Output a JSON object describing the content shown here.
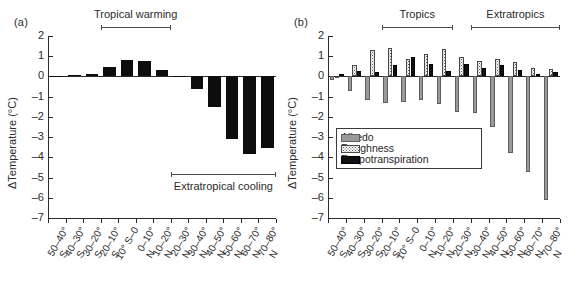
{
  "figure": {
    "panel_a_tag": "(a)",
    "panel_b_tag": "(b)"
  },
  "axes": {
    "ylabel": "ΔTemperature (°C)",
    "yticks": [
      "2",
      "1",
      "0",
      "-1",
      "-2",
      "-3",
      "-4",
      "-5",
      "-6",
      "-7"
    ],
    "ymin": -7,
    "ymax": 2,
    "categories": [
      {
        "line1": "50–40°",
        "line2": "S"
      },
      {
        "line1": "40–30°",
        "line2": "S"
      },
      {
        "line1": "30–20°",
        "line2": "S"
      },
      {
        "line1": "20–10°",
        "line2": "S"
      },
      {
        "line1": "10° S–0",
        "line2": ""
      },
      {
        "line1": "0–10°",
        "line2": "N"
      },
      {
        "line1": "10–20°",
        "line2": "N"
      },
      {
        "line1": "20–30°",
        "line2": "N"
      },
      {
        "line1": "30–40°",
        "line2": "N"
      },
      {
        "line1": "40–50°",
        "line2": "N"
      },
      {
        "line1": "50–60°",
        "line2": "N"
      },
      {
        "line1": "60–70°",
        "line2": "N"
      },
      {
        "line1": "70–80°",
        "line2": "N"
      }
    ]
  },
  "annotations": {
    "panel_a": [
      {
        "text": "Tropical warming",
        "from": 3,
        "to": 6,
        "position": "above"
      },
      {
        "text": "Extratropical cooling",
        "from": 7,
        "to": 12,
        "position": "below"
      }
    ],
    "panel_b": [
      {
        "text": "Tropics",
        "from": 3,
        "to": 6
      },
      {
        "text": "Extratropics",
        "from": 8,
        "to": 12
      }
    ]
  },
  "legend": {
    "position": "inside-left",
    "items": [
      {
        "label": "Albedo",
        "swatch": "albedo",
        "color": "#9a9a9a"
      },
      {
        "label": "Roughness",
        "swatch": "roughness",
        "color": "#ffffff"
      },
      {
        "label": "Evapotranspiration",
        "swatch": "evap",
        "color": "#101010"
      }
    ]
  },
  "chart_data": [
    {
      "type": "bar",
      "panel": "(a)",
      "title": "",
      "xlabel": "",
      "ylabel": "ΔTemperature (°C)",
      "ylim": [
        -7,
        2
      ],
      "grid": false,
      "categories": [
        "50–40° S",
        "40–30° S",
        "30–20° S",
        "20–10° S",
        "10° S–0",
        "0–10° N",
        "10–20° N",
        "20–30° N",
        "30–40° N",
        "40–50° N",
        "50–60° N",
        "60–70° N",
        "70–80° N"
      ],
      "series": [
        {
          "name": "Total temperature change",
          "color": "#0d0d0d",
          "values": [
            0.02,
            0.08,
            0.14,
            0.48,
            0.82,
            0.78,
            0.32,
            -0.04,
            -0.62,
            -1.5,
            -3.1,
            -3.85,
            -3.52
          ]
        }
      ],
      "annotations": [
        "Tropical warming",
        "Extratropical cooling"
      ]
    },
    {
      "type": "bar",
      "panel": "(b)",
      "title": "",
      "xlabel": "",
      "ylabel": "ΔTemperature (°C)",
      "ylim": [
        -7,
        2
      ],
      "grid": false,
      "categories": [
        "50–40° S",
        "40–30° S",
        "30–20° S",
        "20–10° S",
        "10° S–0",
        "0–10° N",
        "10–20° N",
        "20–30° N",
        "30–40° N",
        "40–50° N",
        "50–60° N",
        "60–70° N",
        "70–80° N"
      ],
      "series": [
        {
          "name": "Albedo",
          "color": "#9a9a9a",
          "values": [
            -0.2,
            -0.72,
            -1.15,
            -1.32,
            -1.28,
            -1.15,
            -1.38,
            -1.78,
            -1.8,
            -2.48,
            -3.78,
            -4.72,
            -6.1
          ]
        },
        {
          "name": "Roughness",
          "color": "#ffffff",
          "values": [
            0.04,
            0.55,
            1.32,
            1.4,
            0.88,
            1.12,
            1.34,
            0.97,
            0.75,
            0.88,
            0.73,
            0.43,
            0.38
          ]
        },
        {
          "name": "Evapotranspiration",
          "color": "#101010",
          "values": [
            0.1,
            0.28,
            0.2,
            0.55,
            0.97,
            0.64,
            0.25,
            0.6,
            0.4,
            0.58,
            0.32,
            0.14,
            0.22
          ]
        }
      ],
      "annotations": [
        "Tropics",
        "Extratropics"
      ]
    }
  ]
}
